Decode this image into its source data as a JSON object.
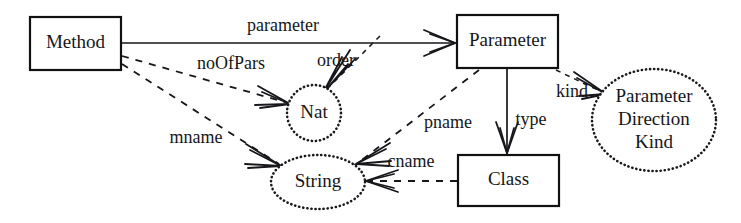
{
  "diagram": {
    "type": "entity-relationship-metamodel",
    "title": "",
    "nodes": [
      {
        "id": "method",
        "label": "Method",
        "shape": "rectangle",
        "x": 30,
        "y": 17,
        "w": 91,
        "h": 53
      },
      {
        "id": "parameter",
        "label": "Parameter",
        "shape": "rectangle",
        "x": 457,
        "y": 15,
        "w": 101,
        "h": 53
      },
      {
        "id": "class",
        "label": "Class",
        "shape": "rectangle",
        "x": 458,
        "y": 155,
        "w": 101,
        "h": 51
      },
      {
        "id": "nat",
        "label": "Nat",
        "shape": "ellipse-dotted",
        "cx": 314,
        "cy": 113,
        "rx": 27,
        "ry": 28
      },
      {
        "id": "string",
        "label": "String",
        "shape": "ellipse-dotted",
        "cx": 318,
        "cy": 182,
        "rx": 47,
        "ry": 27
      },
      {
        "id": "pdk",
        "label": "Parameter Direction Kind",
        "lines": [
          "Parameter",
          "Direction",
          "Kind"
        ],
        "shape": "ellipse-dotted",
        "cx": 654,
        "cy": 120,
        "rx": 62,
        "ry": 51
      }
    ],
    "edges": [
      {
        "id": "e-parameter",
        "label": "parameter",
        "from": "method",
        "to": "parameter",
        "style": "solid",
        "arrow": "open-barb",
        "label_x": 283,
        "label_y": 27
      },
      {
        "id": "e-noofpars",
        "label": "noOfPars",
        "from": "method",
        "to": "nat",
        "style": "dashed",
        "arrow": "open-barb",
        "label_x": 231,
        "label_y": 65
      },
      {
        "id": "e-order",
        "label": "order",
        "from": "parameter",
        "to": "nat",
        "style": "dashed-fine",
        "arrow": "open-barb",
        "label_x": 336,
        "label_y": 62
      },
      {
        "id": "e-mname",
        "label": "mname",
        "from": "method",
        "to": "string",
        "style": "dashed",
        "arrow": "open-barb",
        "label_x": 196,
        "label_y": 139
      },
      {
        "id": "e-pname",
        "label": "pname",
        "from": "parameter",
        "to": "string",
        "style": "dashed",
        "arrow": "open-barb",
        "label_x": 448,
        "label_y": 124
      },
      {
        "id": "e-cname",
        "label": "cname",
        "from": "class",
        "to": "string",
        "style": "dashed",
        "arrow": "open-barb",
        "label_x": 411,
        "label_y": 163
      },
      {
        "id": "e-type",
        "label": "type",
        "from": "parameter",
        "to": "class",
        "style": "solid",
        "arrow": "open-barb",
        "label_x": 531,
        "label_y": 121
      },
      {
        "id": "e-kind",
        "label": "kind",
        "from": "parameter",
        "to": "pdk",
        "style": "dashed-fine",
        "arrow": "open-barb",
        "label_x": 572,
        "label_y": 93
      }
    ],
    "colors": {
      "stroke": "#17171b",
      "text": "#16161a",
      "background": "#ffffff"
    }
  }
}
